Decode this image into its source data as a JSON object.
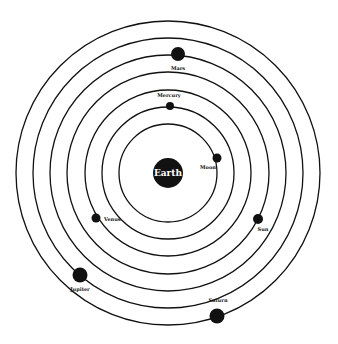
{
  "diagram": {
    "type": "geocentric-model",
    "center": {
      "x": 168,
      "y": 173
    },
    "center_body": {
      "label": "Earth",
      "radius": 15
    },
    "orbit_radii": [
      49,
      66,
      83,
      101,
      118,
      135,
      152
    ],
    "colors": {
      "ring": "#111111",
      "body": "#111111",
      "background": "#ffffff",
      "earth_text": "#ffffff"
    },
    "bodies": [
      {
        "label": "Moon",
        "x": 217,
        "y": 158,
        "r": 4.5,
        "lx": 208,
        "ly": 169,
        "anchor": "middle"
      },
      {
        "label": "Mercury",
        "x": 170,
        "y": 106,
        "r": 4,
        "lx": 169,
        "ly": 97,
        "anchor": "middle"
      },
      {
        "label": "Venus",
        "x": 96,
        "y": 218,
        "r": 4.5,
        "lx": 104,
        "ly": 221,
        "anchor": "start"
      },
      {
        "label": "Sun",
        "x": 258,
        "y": 219,
        "r": 5,
        "lx": 263,
        "ly": 231,
        "anchor": "middle"
      },
      {
        "label": "Mars",
        "x": 178,
        "y": 54,
        "r": 7,
        "lx": 178,
        "ly": 70,
        "anchor": "middle"
      },
      {
        "label": "Jupiter",
        "x": 80,
        "y": 275,
        "r": 7.5,
        "lx": 80,
        "ly": 291,
        "anchor": "middle"
      },
      {
        "label": "Saturn",
        "x": 217,
        "y": 316,
        "r": 7.5,
        "lx": 218,
        "ly": 302,
        "anchor": "middle"
      }
    ]
  }
}
